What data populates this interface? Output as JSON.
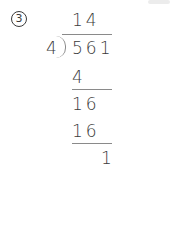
{
  "problem": {
    "number_label": "3",
    "quotient": "14",
    "divisor": "4",
    "dividend": "561",
    "steps": [
      {
        "value": "4"
      },
      {
        "value": "16"
      },
      {
        "value": "16"
      },
      {
        "value": "1"
      }
    ],
    "remainder": "1"
  }
}
